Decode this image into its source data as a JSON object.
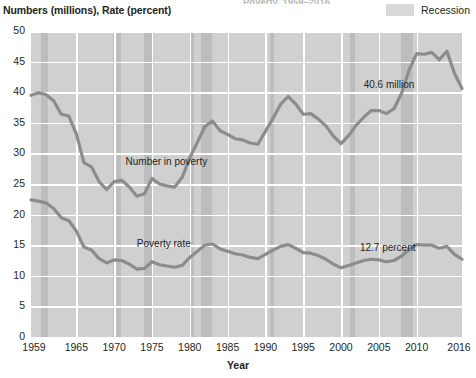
{
  "header": {
    "title_clipped": "Poverty, 1959–2016",
    "y_axis_caption": "Numbers (millions), Rate (percent)",
    "legend": {
      "label": "Recession",
      "swatch_color": "#d9d9d9"
    }
  },
  "chart_data": {
    "type": "line",
    "title": "Poverty, 1959–2016",
    "xlabel": "Year",
    "ylabel": "Numbers (millions), Rate (percent)",
    "xlim": [
      1959,
      2016
    ],
    "ylim": [
      0,
      50
    ],
    "yticks": [
      0,
      5,
      10,
      15,
      20,
      25,
      30,
      35,
      40,
      45,
      50
    ],
    "xticks": [
      1959,
      1965,
      1970,
      1975,
      1980,
      1985,
      1990,
      1995,
      2000,
      2005,
      2010,
      2016
    ],
    "grid": true,
    "legend_position": "top-right",
    "plot_bg": "#d0d0d0",
    "line_color": "#8c8c8c",
    "recession_color": "#bdbdbd",
    "annotations": [
      {
        "text": "Number in poverty",
        "x": 1971.5,
        "y": 28.4
      },
      {
        "text": "Poverty rate",
        "x": 1973.0,
        "y": 15.1
      },
      {
        "text": "40.6 million",
        "x": 2003.0,
        "y": 41.0
      },
      {
        "text": "12.7 percent",
        "x": 2002.5,
        "y": 14.3
      }
    ],
    "recessions": [
      {
        "start": 1960.3,
        "end": 1961.2
      },
      {
        "start": 1969.9,
        "end": 1970.9
      },
      {
        "start": 1973.9,
        "end": 1975.2
      },
      {
        "start": 1980.1,
        "end": 1980.6
      },
      {
        "start": 1981.5,
        "end": 1982.9
      },
      {
        "start": 1990.6,
        "end": 1991.2
      },
      {
        "start": 2001.2,
        "end": 2001.9
      },
      {
        "start": 2007.9,
        "end": 2009.5
      }
    ],
    "x": [
      1959,
      1960,
      1961,
      1962,
      1963,
      1964,
      1965,
      1966,
      1967,
      1968,
      1969,
      1970,
      1971,
      1972,
      1973,
      1974,
      1975,
      1976,
      1977,
      1978,
      1979,
      1980,
      1981,
      1982,
      1983,
      1984,
      1985,
      1986,
      1987,
      1988,
      1989,
      1990,
      1991,
      1992,
      1993,
      1994,
      1995,
      1996,
      1997,
      1998,
      1999,
      2000,
      2001,
      2002,
      2003,
      2004,
      2005,
      2006,
      2007,
      2008,
      2009,
      2010,
      2011,
      2012,
      2013,
      2014,
      2015,
      2016
    ],
    "series": [
      {
        "name": "Number in poverty",
        "unit": "millions",
        "last_value": 40.6,
        "last_label": "40.6 million",
        "values": [
          39.5,
          39.9,
          39.6,
          38.6,
          36.4,
          36.1,
          33.2,
          28.5,
          27.8,
          25.4,
          24.1,
          25.4,
          25.6,
          24.5,
          23.0,
          23.4,
          25.9,
          25.0,
          24.7,
          24.5,
          26.1,
          29.3,
          31.8,
          34.4,
          35.3,
          33.7,
          33.1,
          32.4,
          32.2,
          31.7,
          31.5,
          33.6,
          35.7,
          38.0,
          39.3,
          38.1,
          36.4,
          36.5,
          35.6,
          34.5,
          32.8,
          31.6,
          32.9,
          34.6,
          35.9,
          37.0,
          37.0,
          36.5,
          37.3,
          39.8,
          43.6,
          46.3,
          46.2,
          46.5,
          45.3,
          46.7,
          43.1,
          40.6
        ]
      },
      {
        "name": "Poverty rate",
        "unit": "percent",
        "last_value": 12.7,
        "last_label": "12.7 percent",
        "values": [
          22.4,
          22.2,
          21.9,
          21.0,
          19.5,
          19.0,
          17.3,
          14.7,
          14.2,
          12.8,
          12.1,
          12.6,
          12.5,
          11.9,
          11.1,
          11.2,
          12.3,
          11.8,
          11.6,
          11.4,
          11.7,
          13.0,
          14.0,
          15.0,
          15.2,
          14.4,
          14.0,
          13.6,
          13.4,
          13.0,
          12.8,
          13.5,
          14.2,
          14.8,
          15.1,
          14.5,
          13.8,
          13.7,
          13.3,
          12.7,
          11.9,
          11.3,
          11.7,
          12.1,
          12.5,
          12.7,
          12.6,
          12.3,
          12.5,
          13.2,
          14.3,
          15.1,
          15.0,
          15.0,
          14.5,
          14.8,
          13.5,
          12.7
        ]
      }
    ]
  }
}
